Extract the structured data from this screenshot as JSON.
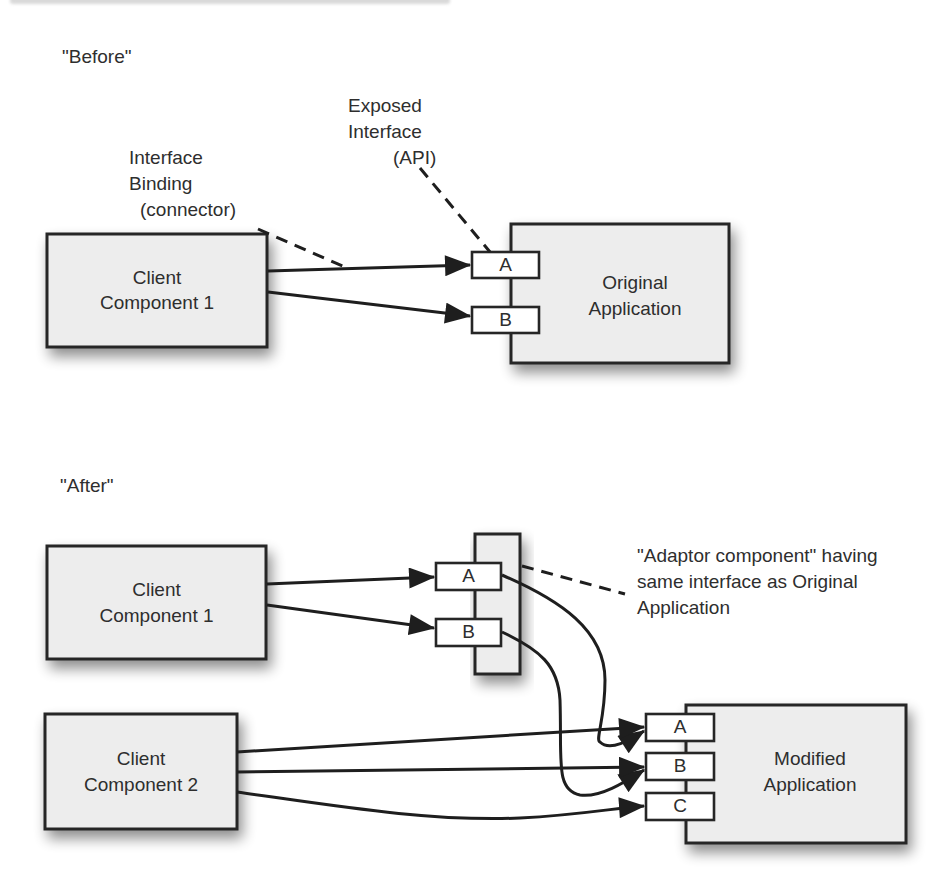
{
  "figure": {
    "top_caption_cropped": "",
    "before": {
      "section_label": "\"Before\"",
      "interface_binding_label": [
        "Interface",
        "Binding",
        "(connector)"
      ],
      "exposed_interface_label": [
        "Exposed",
        "Interface",
        "(API)"
      ],
      "client_component": [
        "Client",
        "Component 1"
      ],
      "application": [
        "Original",
        "Application"
      ],
      "ports": [
        "A",
        "B"
      ]
    },
    "after": {
      "section_label": "\"After\"",
      "client_component_1": [
        "Client",
        "Component 1"
      ],
      "client_component_2": [
        "Client",
        "Component 2"
      ],
      "adaptor_ports": [
        "A",
        "B"
      ],
      "adaptor_note": [
        "\"Adaptor component\" having",
        "same interface as Original",
        "Application"
      ],
      "application": [
        "Modified",
        "Application"
      ],
      "ports": [
        "A",
        "B",
        "C"
      ]
    },
    "colors": {
      "box_fill": "#ededed",
      "stroke": "#262626",
      "port_fill": "#ffffff",
      "text": "#2e2e2e"
    }
  }
}
